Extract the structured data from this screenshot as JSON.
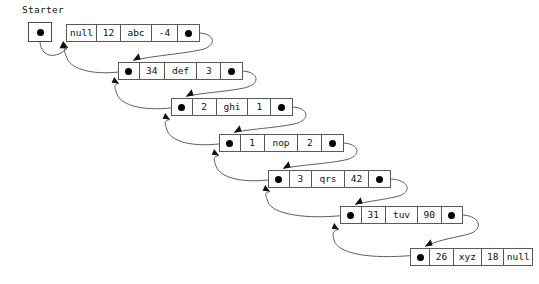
{
  "diagram": {
    "type": "doubly-linked-list",
    "background_color": "#ffffff",
    "line_color": "#5f5f5f",
    "border_color": "#5a5a5a",
    "dot_color": "#000000",
    "text_color": "#111111"
  },
  "starter": {
    "label": "Starter",
    "pointer_glyph": "dot",
    "x": 28,
    "y": 22,
    "width": 24,
    "height": 20
  },
  "nodes": [
    {
      "index": 0,
      "x": 66,
      "y": 24,
      "width": 134,
      "cells": [
        {
          "kind": "prev-pointer",
          "value": "null",
          "width": 30
        },
        {
          "kind": "int",
          "value": "12",
          "width": 24
        },
        {
          "kind": "string",
          "value": "abc",
          "width": 31
        },
        {
          "kind": "int",
          "value": "-4",
          "width": 26
        },
        {
          "kind": "next-pointer",
          "value": "dot",
          "width": 21
        }
      ]
    },
    {
      "index": 1,
      "x": 118,
      "y": 62,
      "width": 125,
      "cells": [
        {
          "kind": "prev-pointer",
          "value": "dot",
          "width": 21
        },
        {
          "kind": "int",
          "value": "34",
          "width": 25
        },
        {
          "kind": "string",
          "value": "def",
          "width": 33
        },
        {
          "kind": "int",
          "value": "3",
          "width": 24
        },
        {
          "kind": "next-pointer",
          "value": "dot",
          "width": 21
        }
      ]
    },
    {
      "index": 2,
      "x": 171,
      "y": 98,
      "width": 122,
      "cells": [
        {
          "kind": "prev-pointer",
          "value": "dot",
          "width": 21
        },
        {
          "kind": "int",
          "value": "2",
          "width": 24
        },
        {
          "kind": "string",
          "value": "ghi",
          "width": 32
        },
        {
          "kind": "int",
          "value": "1",
          "width": 23
        },
        {
          "kind": "next-pointer",
          "value": "dot",
          "width": 21
        }
      ]
    },
    {
      "index": 3,
      "x": 219,
      "y": 134,
      "width": 125,
      "cells": [
        {
          "kind": "prev-pointer",
          "value": "dot",
          "width": 21
        },
        {
          "kind": "int",
          "value": "1",
          "width": 24
        },
        {
          "kind": "string",
          "value": "nop",
          "width": 34
        },
        {
          "kind": "int",
          "value": "2",
          "width": 24
        },
        {
          "kind": "next-pointer",
          "value": "dot",
          "width": 21
        }
      ]
    },
    {
      "index": 4,
      "x": 268,
      "y": 170,
      "width": 123,
      "cells": [
        {
          "kind": "prev-pointer",
          "value": "dot",
          "width": 21
        },
        {
          "kind": "int",
          "value": "3",
          "width": 23
        },
        {
          "kind": "string",
          "value": "qrs",
          "width": 33
        },
        {
          "kind": "int",
          "value": "42",
          "width": 25
        },
        {
          "kind": "next-pointer",
          "value": "dot",
          "width": 21
        }
      ]
    },
    {
      "index": 5,
      "x": 340,
      "y": 206,
      "width": 123,
      "cells": [
        {
          "kind": "prev-pointer",
          "value": "dot",
          "width": 21
        },
        {
          "kind": "int",
          "value": "31",
          "width": 25
        },
        {
          "kind": "string",
          "value": "tuv",
          "width": 33
        },
        {
          "kind": "int",
          "value": "90",
          "width": 24
        },
        {
          "kind": "next-pointer",
          "value": "dot",
          "width": 21
        }
      ]
    },
    {
      "index": 6,
      "x": 410,
      "y": 248,
      "width": 123,
      "cells": [
        {
          "kind": "prev-pointer",
          "value": "dot",
          "width": 21
        },
        {
          "kind": "int",
          "value": "26",
          "width": 25
        },
        {
          "kind": "string",
          "value": "xyz",
          "width": 31
        },
        {
          "kind": "int",
          "value": "18",
          "width": 24
        },
        {
          "kind": "next-pointer",
          "value": "null",
          "width": 30
        }
      ]
    }
  ],
  "arrows": {
    "starter_to_head": {
      "from": "starter",
      "to": "node-0-left",
      "path": "M40,42 C40,52 48,58 60,52 L66,48"
    },
    "forward": [
      {
        "from": "node-0-next",
        "to": "node-1-top-left",
        "path": "M196,33 C214,33 218,46 200,50 C180,54 150,56 131,61"
      },
      {
        "from": "node-1-next",
        "to": "node-2-top-left",
        "path": "M239,71 C258,71 262,83 244,87 C224,92 198,93 184,97"
      },
      {
        "from": "node-2-next",
        "to": "node-3-top-left",
        "path": "M289,107 C308,107 312,119 294,123 C274,128 248,129 232,133"
      },
      {
        "from": "node-3-next",
        "to": "node-4-top-left",
        "path": "M340,143 C359,143 363,155 345,159 C325,164 298,165 281,169"
      },
      {
        "from": "node-4-next",
        "to": "node-5-top-left",
        "path": "M387,179 C408,179 414,192 394,196 C374,201 368,200 353,205"
      },
      {
        "from": "node-5-next",
        "to": "node-6-top-left",
        "path": "M459,215 C480,215 484,230 464,234 C446,238 437,239 423,247"
      }
    ],
    "backward": [
      {
        "from": "node-1-prev",
        "to": "node-0-left",
        "path": "M126,71 C96,75 72,70 68,58 C65,48 60,46 66,46"
      },
      {
        "from": "node-2-prev",
        "to": "node-1-left",
        "path": "M178,107 C146,111 122,106 118,94 C115,84 112,82 118,82"
      },
      {
        "from": "node-3-prev",
        "to": "node-2-left",
        "path": "M226,143 C194,147 172,142 168,130 C165,120 164,118 170,118"
      },
      {
        "from": "node-4-prev",
        "to": "node-3-left",
        "path": "M275,179 C243,183 221,178 217,166 C214,156 213,154 219,154"
      },
      {
        "from": "node-5-prev",
        "to": "node-4-left",
        "path": "M347,215 C308,219 274,214 270,202 C267,192 263,190 269,190"
      },
      {
        "from": "node-6-prev",
        "to": "node-5-left",
        "path": "M417,255 C370,259 339,253 336,240 C334,230 334,228 340,228"
      }
    ]
  }
}
